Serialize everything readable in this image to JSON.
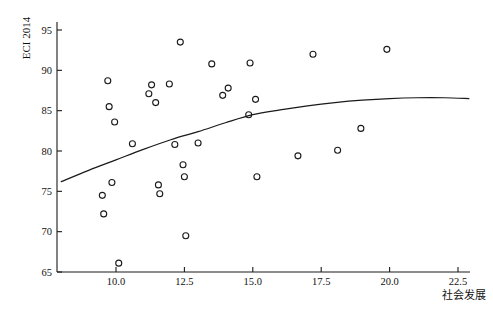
{
  "chart_data": {
    "type": "scatter",
    "title": "",
    "subtitle": "",
    "xlabel": "社会发展",
    "ylabel": "ECI 2014",
    "xlim": [
      8.0,
      23.1
    ],
    "ylim": [
      65,
      96.4
    ],
    "grid": false,
    "legend": "none",
    "x_ticks": [
      "10.0",
      "12.5",
      "15.0",
      "17.5",
      "20.0",
      "22.5"
    ],
    "x_tick_values": [
      10.0,
      12.5,
      15.0,
      17.5,
      20.0,
      22.5
    ],
    "y_ticks": [
      "65",
      "70",
      "75",
      "80",
      "85",
      "90",
      "95"
    ],
    "y_tick_values": [
      65,
      70,
      75,
      80,
      85,
      90,
      95
    ],
    "marker": "open-circle",
    "marker_color": "#1a1a1a",
    "points": [
      {
        "x": 9.5,
        "y": 74.5
      },
      {
        "x": 9.55,
        "y": 72.2
      },
      {
        "x": 9.7,
        "y": 88.7
      },
      {
        "x": 9.75,
        "y": 85.5
      },
      {
        "x": 9.85,
        "y": 76.1
      },
      {
        "x": 9.95,
        "y": 83.6
      },
      {
        "x": 10.1,
        "y": 66.1
      },
      {
        "x": 10.6,
        "y": 80.9
      },
      {
        "x": 11.2,
        "y": 87.1
      },
      {
        "x": 11.3,
        "y": 88.2
      },
      {
        "x": 11.45,
        "y": 86.0
      },
      {
        "x": 11.55,
        "y": 75.8
      },
      {
        "x": 11.6,
        "y": 74.7
      },
      {
        "x": 11.95,
        "y": 88.3
      },
      {
        "x": 12.15,
        "y": 80.8
      },
      {
        "x": 12.35,
        "y": 93.5
      },
      {
        "x": 12.45,
        "y": 78.3
      },
      {
        "x": 12.5,
        "y": 76.8
      },
      {
        "x": 12.55,
        "y": 69.5
      },
      {
        "x": 13.0,
        "y": 81.0
      },
      {
        "x": 13.5,
        "y": 90.8
      },
      {
        "x": 13.9,
        "y": 86.9
      },
      {
        "x": 14.1,
        "y": 87.8
      },
      {
        "x": 14.85,
        "y": 84.5
      },
      {
        "x": 14.9,
        "y": 90.9
      },
      {
        "x": 15.1,
        "y": 86.4
      },
      {
        "x": 15.15,
        "y": 76.8
      },
      {
        "x": 16.65,
        "y": 79.4
      },
      {
        "x": 17.2,
        "y": 92.0
      },
      {
        "x": 18.1,
        "y": 80.1
      },
      {
        "x": 18.95,
        "y": 82.8
      },
      {
        "x": 19.9,
        "y": 92.6
      }
    ],
    "fit_curve": {
      "label": "",
      "color": "#1a1a1a",
      "points": [
        {
          "x": 8.0,
          "y": 76.2
        },
        {
          "x": 9.0,
          "y": 77.6
        },
        {
          "x": 10.0,
          "y": 78.9
        },
        {
          "x": 11.0,
          "y": 80.2
        },
        {
          "x": 12.0,
          "y": 81.4
        },
        {
          "x": 13.0,
          "y": 82.4
        },
        {
          "x": 14.0,
          "y": 83.5
        },
        {
          "x": 15.0,
          "y": 84.5
        },
        {
          "x": 16.0,
          "y": 85.1
        },
        {
          "x": 17.0,
          "y": 85.6
        },
        {
          "x": 18.0,
          "y": 86.0
        },
        {
          "x": 19.0,
          "y": 86.3
        },
        {
          "x": 20.0,
          "y": 86.5
        },
        {
          "x": 21.0,
          "y": 86.6
        },
        {
          "x": 22.0,
          "y": 86.6
        },
        {
          "x": 22.9,
          "y": 86.5
        }
      ]
    }
  }
}
